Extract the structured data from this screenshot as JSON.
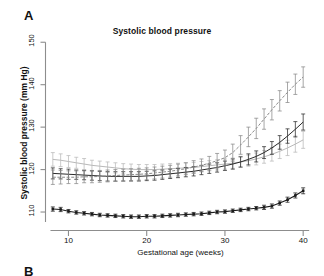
{
  "figure": {
    "panel_a_label": "A",
    "panel_b_label": "B"
  },
  "chart_data": {
    "type": "line",
    "title": "Systolic blood pressure",
    "xlabel": "Gestational age (weeks)",
    "ylabel": "Systolic blood pressure (mm Hg)",
    "xlim": [
      7,
      41
    ],
    "ylim": [
      106,
      151
    ],
    "xticks": [
      10,
      20,
      30,
      40
    ],
    "yticks": [
      110,
      120,
      130,
      140,
      150
    ],
    "xtick_labels": [
      "10",
      "20",
      "30",
      "40"
    ],
    "ytick_labels": [
      "110",
      "120",
      "130",
      "140",
      "150"
    ],
    "grid": false,
    "legend": "none",
    "error_bars": "vertical, capped",
    "x": [
      8,
      9,
      10,
      11,
      12,
      13,
      14,
      15,
      16,
      17,
      18,
      19,
      20,
      21,
      22,
      23,
      24,
      25,
      26,
      27,
      28,
      29,
      30,
      31,
      32,
      33,
      34,
      35,
      36,
      37,
      38,
      39,
      40
    ],
    "series": [
      {
        "name": "upper-light-gray-curve",
        "color": "#b9b9b9",
        "marker": "none",
        "linestyle": "solid",
        "values": [
          122.4,
          122.2,
          121.9,
          121.6,
          121.3,
          121.0,
          120.8,
          120.6,
          120.4,
          120.2,
          120.1,
          120.0,
          120.0,
          120.0,
          120.1,
          120.2,
          120.3,
          120.4,
          120.5,
          120.7,
          120.9,
          121.1,
          121.3,
          121.5,
          121.8,
          122.1,
          122.5,
          123.0,
          123.6,
          124.3,
          125.1,
          126.0,
          127.0
        ],
        "error": [
          1.6,
          1.5,
          1.4,
          1.3,
          1.3,
          1.2,
          1.2,
          1.2,
          1.2,
          1.2,
          1.2,
          1.2,
          1.2,
          1.2,
          1.2,
          1.2,
          1.2,
          1.2,
          1.2,
          1.2,
          1.2,
          1.2,
          1.2,
          1.2,
          1.3,
          1.3,
          1.4,
          1.5,
          1.6,
          1.7,
          1.8,
          1.9,
          2.0
        ]
      },
      {
        "name": "middle-dark-curve",
        "color": "#2b2b2b",
        "marker": "none",
        "linestyle": "solid",
        "values": [
          119.1,
          119.0,
          118.9,
          118.8,
          118.7,
          118.6,
          118.5,
          118.4,
          118.4,
          118.4,
          118.4,
          118.4,
          118.5,
          118.6,
          118.8,
          119.0,
          119.2,
          119.4,
          119.6,
          119.9,
          120.2,
          120.5,
          120.9,
          121.3,
          121.8,
          122.4,
          123.1,
          124.0,
          125.1,
          126.4,
          127.9,
          129.5,
          131.2
        ],
        "error": [
          1.3,
          1.2,
          1.2,
          1.1,
          1.1,
          1.1,
          1.1,
          1.1,
          1.1,
          1.1,
          1.1,
          1.1,
          1.1,
          1.1,
          1.1,
          1.1,
          1.1,
          1.1,
          1.1,
          1.1,
          1.1,
          1.1,
          1.1,
          1.2,
          1.2,
          1.3,
          1.3,
          1.4,
          1.5,
          1.6,
          1.7,
          1.8,
          1.9
        ]
      },
      {
        "name": "steep-gray-dashed-curve",
        "color": "#8a8a8a",
        "marker": "none",
        "linestyle": "dashed",
        "values": [
          118.2,
          118.2,
          118.2,
          118.2,
          118.3,
          118.3,
          118.4,
          118.5,
          118.6,
          118.7,
          118.8,
          118.9,
          119.0,
          119.2,
          119.4,
          119.6,
          119.9,
          120.2,
          120.6,
          121.0,
          121.5,
          122.1,
          122.8,
          124.0,
          125.8,
          127.7,
          129.7,
          131.9,
          134.1,
          136.2,
          138.2,
          140.1,
          141.8
        ],
        "error": [
          1.7,
          1.6,
          1.5,
          1.5,
          1.4,
          1.4,
          1.4,
          1.4,
          1.4,
          1.4,
          1.4,
          1.4,
          1.4,
          1.4,
          1.4,
          1.4,
          1.4,
          1.4,
          1.5,
          1.5,
          1.6,
          1.7,
          1.8,
          2.0,
          2.2,
          2.3,
          2.4,
          2.4,
          2.4,
          2.4,
          2.4,
          2.4,
          2.4
        ]
      },
      {
        "name": "bottom-dark-curve",
        "color": "#1b1b1b",
        "marker": "square",
        "linestyle": "solid",
        "values": [
          110.7,
          110.6,
          110.2,
          109.9,
          109.7,
          109.5,
          109.3,
          109.2,
          109.1,
          109.0,
          108.9,
          108.9,
          109.0,
          109.0,
          109.1,
          109.2,
          109.3,
          109.4,
          109.5,
          109.6,
          109.8,
          110.0,
          110.1,
          110.3,
          110.5,
          110.7,
          110.9,
          111.1,
          111.4,
          112.1,
          112.9,
          113.9,
          115.0
        ],
        "error": [
          0.5,
          0.5,
          0.4,
          0.4,
          0.4,
          0.4,
          0.4,
          0.4,
          0.4,
          0.4,
          0.4,
          0.4,
          0.4,
          0.4,
          0.4,
          0.4,
          0.4,
          0.4,
          0.4,
          0.4,
          0.4,
          0.4,
          0.4,
          0.4,
          0.4,
          0.4,
          0.4,
          0.5,
          0.5,
          0.5,
          0.6,
          0.6,
          0.7
        ]
      }
    ]
  }
}
